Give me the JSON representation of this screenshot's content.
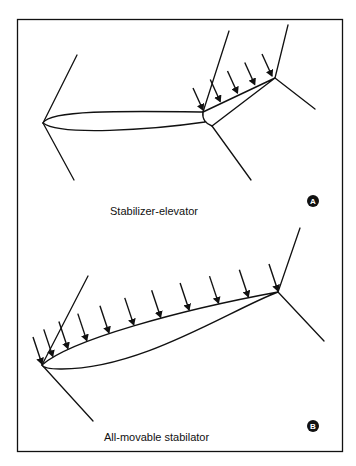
{
  "figure": {
    "panels": [
      {
        "id": "A",
        "badge": "A",
        "caption": "Stabilizer-elevator",
        "arrow_count": 5
      },
      {
        "id": "B",
        "badge": "B",
        "caption": "All-movable stabilator",
        "arrow_count": 11
      }
    ],
    "colors": {
      "ink": "#111111",
      "background": "#ffffff"
    }
  }
}
